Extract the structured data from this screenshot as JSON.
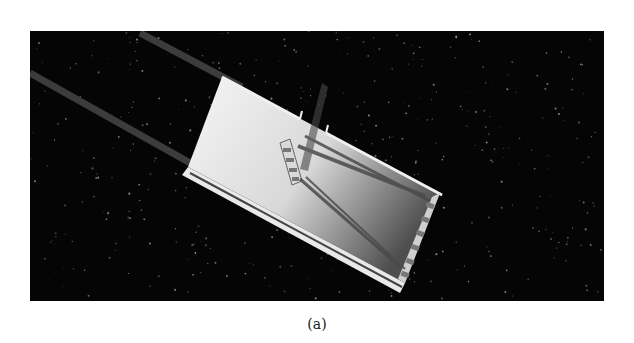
{
  "figure": {
    "caption": "(a)",
    "colors": {
      "background": "#050505",
      "page": "#ffffff",
      "housing_light": "#f4f4f4",
      "housing_dark": "#5a5a5a",
      "rod": "#3a3a3a",
      "beam": "#555555"
    }
  }
}
